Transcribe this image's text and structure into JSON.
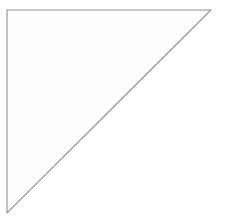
{
  "figure": {
    "type": "geometric-diagram",
    "background_color": "#ffffff",
    "line_color": "#8a8a8a",
    "fill_color": "#ffffff",
    "line_width": 1,
    "canvas": {
      "width": 230,
      "height": 224
    }
  },
  "chart_data": {
    "type": "diagram",
    "title": "",
    "shape": "right-triangle",
    "triangle": {
      "vertices": [
        {
          "label": "top-left",
          "x": 7,
          "y": 10
        },
        {
          "label": "top-right",
          "x": 211,
          "y": 10
        },
        {
          "label": "bottom-left",
          "x": 7,
          "y": 213
        }
      ],
      "leg_length_px": 204,
      "right_angle_at": "top-left",
      "hypotenuse_from": "top-right",
      "hypotenuse_to": "bottom-left"
    },
    "grid": {
      "style": "diamond",
      "rotation_deg": 45,
      "spacing_px": 25.5,
      "diagonal_period_px": 51,
      "origin": {
        "x": 7,
        "y": 10
      },
      "top_edge_intersections_x": [
        60,
        112,
        163
      ],
      "left_edge_intersections_y": [
        62,
        113,
        164
      ]
    },
    "counts": {
      "full_squares": 10,
      "half_triangles": 8,
      "grid_lines_ascending": 4,
      "grid_lines_descending": 4
    }
  },
  "labels": {
    "figure_caption": ""
  }
}
